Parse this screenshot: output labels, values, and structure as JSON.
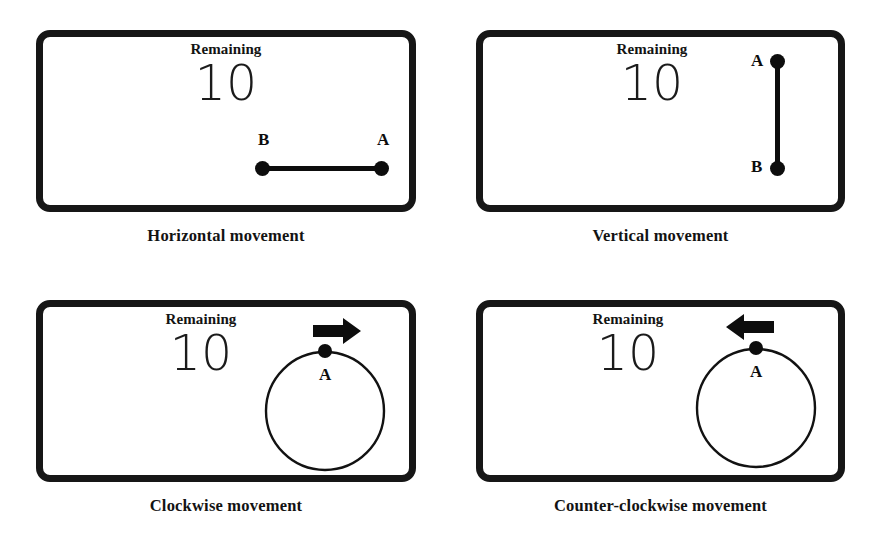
{
  "page": {
    "background": "#ffffff",
    "ink": "#111111",
    "width": 878,
    "height": 542
  },
  "panels": [
    {
      "id": "horizontal",
      "caption": "Horizontal movement",
      "remaining_label": "Remaining",
      "remaining_value": "10",
      "stimulus": "line-horizontal",
      "point_labels": [
        "B",
        "A"
      ],
      "arrow": null
    },
    {
      "id": "vertical",
      "caption": "Vertical movement",
      "remaining_label": "Remaining",
      "remaining_value": "10",
      "stimulus": "line-vertical",
      "point_labels": [
        "A",
        "B"
      ],
      "arrow": null
    },
    {
      "id": "clockwise",
      "caption": "Clockwise movement",
      "remaining_label": "Remaining",
      "remaining_value": "10",
      "stimulus": "circle",
      "point_labels": [
        "A"
      ],
      "arrow": "arrow-right-icon"
    },
    {
      "id": "counter-clockwise",
      "caption": "Counter-clockwise movement",
      "remaining_label": "Remaining",
      "remaining_value": "10",
      "stimulus": "circle",
      "point_labels": [
        "A"
      ],
      "arrow": "arrow-left-icon"
    }
  ]
}
